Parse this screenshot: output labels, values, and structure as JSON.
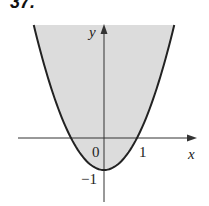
{
  "chart_data": {
    "type": "area",
    "title": "",
    "problem_number": "37.",
    "xlabel": "x",
    "ylabel": "y",
    "function": "y = x^2 - 1",
    "shaded_region": "y >= x^2 - 1",
    "xlim": [
      -3.1,
      3.2
    ],
    "ylim": [
      -1.9,
      3.5
    ],
    "x_ticks": [
      {
        "value": 0,
        "label": "0"
      },
      {
        "value": 1,
        "label": "1"
      }
    ],
    "y_ticks": [
      {
        "value": -1,
        "label": "−1"
      }
    ],
    "grid": false,
    "colors": {
      "fill": "#dcdcdc",
      "curve": "#222222",
      "axis": "#333333"
    }
  }
}
